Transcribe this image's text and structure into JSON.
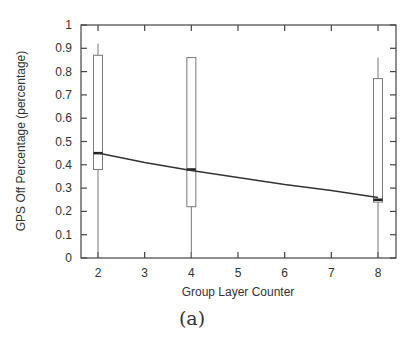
{
  "caption": "(a)",
  "chart_data": {
    "type": "box",
    "title": "",
    "xlabel": "Group Layer Counter",
    "ylabel": "GPS Off Percentage (percentage)",
    "xlim": [
      1.75,
      8.25
    ],
    "ylim": [
      0,
      1
    ],
    "x_ticks": [
      2,
      3,
      4,
      5,
      6,
      7,
      8
    ],
    "y_ticks": [
      0,
      0.1,
      0.2,
      0.3,
      0.4,
      0.5,
      0.6,
      0.7,
      0.8,
      0.9,
      1
    ],
    "y_tick_labels": [
      "0",
      "0.1",
      "0.2",
      "0.3",
      "0.4",
      "0.5",
      "0.6",
      "0.7",
      "0.8",
      "0.9",
      "1"
    ],
    "grid": false,
    "boxes": [
      {
        "x": 2,
        "whisker_low": 0.0,
        "q1": 0.38,
        "median": 0.45,
        "q3": 0.87,
        "whisker_high": 0.92
      },
      {
        "x": 4,
        "whisker_low": 0.0,
        "q1": 0.22,
        "median": 0.38,
        "q3": 0.86,
        "whisker_high": 0.86
      },
      {
        "x": 8,
        "whisker_low": 0.0,
        "q1": 0.24,
        "median": 0.25,
        "q3": 0.77,
        "whisker_high": 0.86
      }
    ],
    "trend_line": {
      "name": "fit",
      "x": [
        2,
        3,
        4,
        5,
        6,
        7,
        8
      ],
      "y": [
        0.45,
        0.41,
        0.375,
        0.345,
        0.315,
        0.29,
        0.26
      ]
    }
  }
}
